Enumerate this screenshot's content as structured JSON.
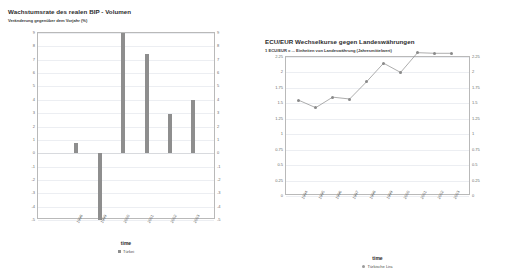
{
  "charts": {
    "left": {
      "title": "Wachstumsrate des realen BIP - Volumen",
      "subtitle": "Veränderung gegenüber dem Vorjahr (%)",
      "xlabel": "time",
      "legend": "Türkei"
    },
    "right": {
      "title": "ECU/EUR Wechselkurse gegen Landeswährungen",
      "subtitle": "1 ECU/EUR = ... Einheiten von Landeswährung (Jahresmittelwert)",
      "xlabel": "time",
      "legend": "Türkische Lira"
    }
  },
  "chart_data": [
    {
      "type": "bar",
      "id": "gdp-growth-turkey",
      "title": "Wachstumsrate des realen BIP - Volumen",
      "subtitle": "Veränderung gegenüber dem Vorjahr (%)",
      "xlabel": "time",
      "ylabel": "",
      "legend": [
        "Türkei"
      ],
      "legend_position": "bottom",
      "grid": true,
      "categories": [
        "1998",
        "1999",
        "2000",
        "2001",
        "2002",
        "2003"
      ],
      "values": [
        0.8,
        -5.0,
        9.0,
        7.4,
        2.9,
        4.0
      ],
      "ylim": [
        -5,
        9
      ],
      "yticks": [
        9,
        8,
        7,
        6,
        5,
        4,
        3,
        2,
        1,
        0,
        -1,
        -2,
        -3,
        -4,
        -5
      ],
      "ytick_labels": [
        "9",
        "8",
        "7",
        "6",
        "5",
        "4",
        "3",
        "2",
        "1",
        "0",
        "-1",
        "-2",
        "-3",
        "-4",
        "-5"
      ],
      "series_color": "#8e8e8e"
    },
    {
      "type": "line",
      "id": "ecu-eur-turkish-lira",
      "title": "ECU/EUR Wechselkurse gegen Landeswährungen",
      "subtitle": "1 ECU/EUR = ... Einheiten von Landeswährung (Jahresmittelwert)",
      "xlabel": "time",
      "ylabel": "",
      "legend": [
        "Türkische Lira"
      ],
      "legend_position": "bottom",
      "grid": true,
      "x": [
        "1994",
        "1995",
        "1996",
        "1997",
        "1998",
        "1999",
        "2000",
        "2001",
        "2002",
        "2003"
      ],
      "values": [
        1.55,
        1.43,
        1.6,
        1.57,
        1.85,
        2.15,
        2.0,
        2.32,
        2.31,
        2.31
      ],
      "ylim": [
        0,
        2.25
      ],
      "yticks": [
        0,
        0.25,
        0.5,
        0.75,
        1,
        1.25,
        1.5,
        1.75,
        2,
        2.25
      ],
      "ytick_labels": [
        "0",
        "0.25",
        "0.5",
        "0.75",
        "1",
        "1.25",
        "1.5",
        "1.75",
        "2",
        "2.25"
      ],
      "series_color": "#8a8a8a"
    }
  ]
}
